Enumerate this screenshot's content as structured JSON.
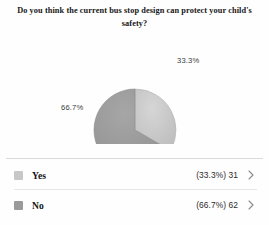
{
  "title": "Do you think the current bus stop design can protect your child's safety?",
  "chart_data": {
    "type": "pie",
    "title": "Do you think the current bus stop design can protect your child's safety?",
    "categories": [
      "Yes",
      "No"
    ],
    "values": [
      31,
      62
    ],
    "percents": [
      33.3,
      66.7
    ],
    "labels": [
      "33.3%",
      "66.7%"
    ],
    "colors": [
      "#c7c7c7",
      "#9a9a9a"
    ],
    "legend_position": "bottom",
    "total": 93,
    "start_angle_deg": 0,
    "direction": "clockwise"
  },
  "pie": {
    "slices": [
      {
        "name": "Yes",
        "label": "33.3%",
        "percent": 33.3,
        "color": "#c7c7c7"
      },
      {
        "name": "No",
        "label": "66.7%",
        "percent": 66.7,
        "color": "#9a9a9a"
      }
    ]
  },
  "legend": {
    "rows": [
      {
        "label": "Yes",
        "value": "(33.3%) 31",
        "percent_text": "33.3%",
        "count": 31,
        "swatch_color": "#c7c7c7",
        "chevron": "chevron-right-icon"
      },
      {
        "label": "No",
        "value": "(66.7%) 62",
        "percent_text": "66.7%",
        "count": 62,
        "swatch_color": "#9a9a9a",
        "chevron": "chevron-right-icon"
      }
    ]
  }
}
